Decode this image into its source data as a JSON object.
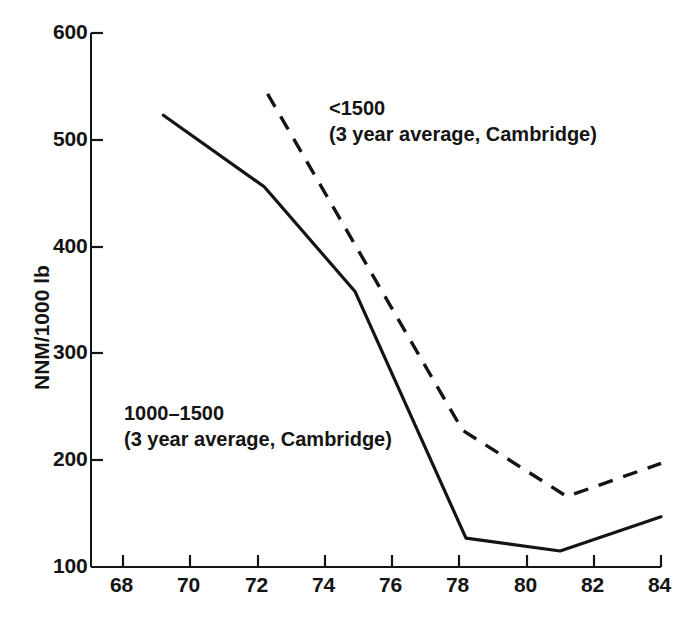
{
  "chart_data": {
    "type": "line",
    "title": "",
    "xlabel": "",
    "ylabel": "NNM/1000 lb",
    "xlim": [
      68,
      84
    ],
    "ylim": [
      100,
      600
    ],
    "xticks": [
      68,
      70,
      72,
      74,
      76,
      78,
      80,
      82,
      84
    ],
    "yticks": [
      100,
      200,
      300,
      400,
      500,
      600
    ],
    "grid": false,
    "legend": "inline-annotations",
    "series": [
      {
        "name": "1000–1500 (3 year average, Cambridge)",
        "style": "solid",
        "color": "#141414",
        "x": [
          69.2,
          72.2,
          74.9,
          78.2,
          81.0,
          84.0
        ],
        "y": [
          523,
          456,
          358,
          127,
          115,
          147
        ]
      },
      {
        "name": "<1500 (3 year average, Cambridge)",
        "style": "dashed",
        "color": "#141414",
        "x": [
          72.3,
          78.1,
          81.2,
          84.0
        ],
        "y": [
          543,
          228,
          166,
          197
        ]
      }
    ],
    "annotations": [
      {
        "id": "annot-upper",
        "line1": "<1500",
        "line2": "(3 year average, Cambridge)"
      },
      {
        "id": "annot-lower",
        "line1": "1000–1500",
        "line2": "(3 year average, Cambridge)"
      }
    ]
  },
  "axis": {
    "y_title": "NNM/1000 lb",
    "y_tick_labels": [
      "600",
      "500",
      "400",
      "300",
      "200",
      "100"
    ],
    "x_tick_labels": [
      "68",
      "70",
      "72",
      "74",
      "76",
      "78",
      "80",
      "82",
      "84"
    ]
  },
  "colors": {
    "ink": "#141414",
    "background": "#ffffff"
  }
}
